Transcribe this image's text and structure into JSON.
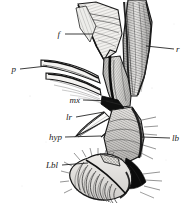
{
  "figure": {
    "kind": "scientific-illustration",
    "background_color": "#ffffff",
    "ink_color": "#1a1a1a",
    "width": 192,
    "height": 204,
    "labels": [
      {
        "id": "f",
        "text": "f",
        "x": 60,
        "y": 37,
        "anchor": "end",
        "font_size": 9,
        "leader": {
          "x1": 65,
          "y1": 34,
          "x2": 93,
          "y2": 34
        }
      },
      {
        "id": "p",
        "text": "p",
        "x": 16,
        "y": 72,
        "anchor": "end",
        "font_size": 9,
        "leader": {
          "x1": 20,
          "y1": 69,
          "x2": 47,
          "y2": 66
        }
      },
      {
        "id": "r",
        "text": "r",
        "x": 176,
        "y": 52,
        "anchor": "start",
        "font_size": 9,
        "leader": {
          "x1": 174,
          "y1": 49,
          "x2": 146,
          "y2": 46
        }
      },
      {
        "id": "mx",
        "text": "mx",
        "x": 80,
        "y": 103,
        "anchor": "end",
        "font_size": 9,
        "leader": {
          "x1": 83,
          "y1": 100,
          "x2": 113,
          "y2": 101
        }
      },
      {
        "id": "lr",
        "text": "lr",
        "x": 72,
        "y": 120,
        "anchor": "end",
        "font_size": 9,
        "leader": {
          "x1": 76,
          "y1": 117,
          "x2": 104,
          "y2": 112
        }
      },
      {
        "id": "hyp",
        "text": "hyp",
        "x": 62,
        "y": 140,
        "anchor": "end",
        "font_size": 9,
        "leader": {
          "x1": 65,
          "y1": 137,
          "x2": 101,
          "y2": 136
        }
      },
      {
        "id": "lb",
        "text": "lb",
        "x": 172,
        "y": 141,
        "anchor": "start",
        "font_size": 9,
        "leader": {
          "x1": 170,
          "y1": 138,
          "x2": 142,
          "y2": 137
        }
      },
      {
        "id": "Lbl",
        "text": "Lbl",
        "x": 58,
        "y": 168,
        "anchor": "end",
        "font_size": 9,
        "leader": {
          "x1": 62,
          "y1": 165,
          "x2": 88,
          "y2": 163
        }
      }
    ]
  }
}
